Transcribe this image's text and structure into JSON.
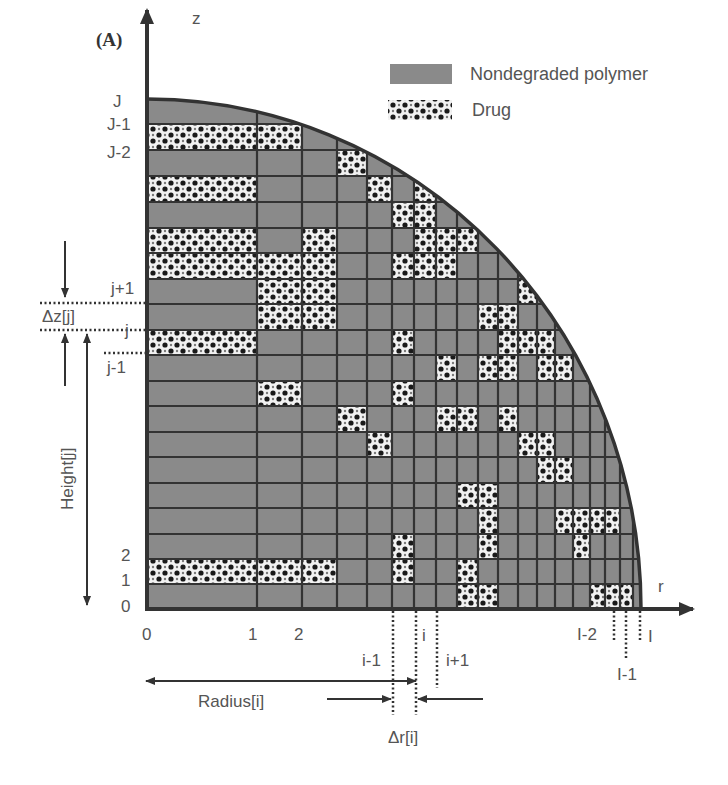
{
  "figure": {
    "panel_label": "(A)",
    "colors": {
      "polymer": "#8a8a8a",
      "grid_line": "#333333",
      "axis": "#333333",
      "drug_bg": "#f2f2f2",
      "drug_dot": "#1a1a1a",
      "text": "#555555"
    },
    "geometry": {
      "origin": [
        147,
        609
      ],
      "radius_r": 494,
      "radius_z": 510,
      "col_lines": [
        147,
        257,
        302,
        337,
        367,
        392,
        414,
        436,
        457,
        478,
        498,
        518,
        537,
        555,
        573,
        590,
        605,
        620,
        633,
        641
      ],
      "row_lines": [
        609,
        584,
        559,
        534,
        508,
        483,
        457,
        432,
        406,
        381,
        355,
        330,
        304,
        279,
        253,
        228,
        202,
        176,
        150,
        124,
        99
      ]
    },
    "drug_cells": [
      [
        0,
        1
      ],
      [
        1,
        1
      ],
      [
        2,
        1
      ],
      [
        1,
        8
      ],
      [
        0,
        10
      ],
      [
        0,
        13
      ],
      [
        0,
        14
      ],
      [
        0,
        16
      ],
      [
        0,
        18
      ],
      [
        1,
        11
      ],
      [
        1,
        12
      ],
      [
        1,
        13
      ],
      [
        2,
        11
      ],
      [
        2,
        12
      ],
      [
        2,
        13
      ],
      [
        2,
        14
      ],
      [
        1,
        18
      ],
      [
        3,
        7
      ],
      [
        4,
        6
      ],
      [
        4,
        16
      ],
      [
        5,
        10
      ],
      [
        5,
        13
      ],
      [
        5,
        15
      ],
      [
        3,
        17
      ],
      [
        6,
        15
      ],
      [
        6,
        16
      ],
      [
        5,
        8
      ],
      [
        5,
        2
      ],
      [
        5,
        1
      ],
      [
        6,
        14
      ],
      [
        7,
        14
      ],
      [
        7,
        7
      ],
      [
        8,
        7
      ],
      [
        6,
        13
      ],
      [
        7,
        13
      ],
      [
        7,
        9
      ],
      [
        8,
        0
      ],
      [
        8,
        1
      ],
      [
        8,
        14
      ],
      [
        8,
        4
      ],
      [
        9,
        4
      ],
      [
        9,
        3
      ],
      [
        9,
        2
      ],
      [
        9,
        0
      ],
      [
        9,
        11
      ],
      [
        10,
        11
      ],
      [
        10,
        10
      ],
      [
        9,
        9
      ],
      [
        11,
        12
      ],
      [
        10,
        9
      ],
      [
        11,
        10
      ],
      [
        11,
        6
      ],
      [
        12,
        6
      ],
      [
        12,
        9
      ],
      [
        13,
        9
      ],
      [
        13,
        3
      ],
      [
        14,
        3
      ],
      [
        15,
        3
      ],
      [
        16,
        3
      ],
      [
        14,
        2
      ],
      [
        15,
        0
      ],
      [
        16,
        0
      ],
      [
        15,
        9
      ],
      [
        13,
        5
      ],
      [
        12,
        5
      ],
      [
        17,
        0
      ],
      [
        12,
        10
      ],
      [
        10,
        7
      ]
    ],
    "legend": {
      "items": [
        {
          "label": "Nondegraded polymer",
          "type": "polymer"
        },
        {
          "label": "Drug",
          "type": "drug"
        }
      ]
    },
    "axes": {
      "z_label": "z",
      "r_label": "r"
    },
    "z_tick_labels": {
      "top": [
        "J",
        "J-1",
        "J-2"
      ],
      "bottom": [
        "2",
        "1",
        "0"
      ]
    },
    "r_tick_labels": [
      "0",
      "1",
      "2"
    ],
    "annotations": {
      "j_plus_1": "j+1",
      "j": "j",
      "j_minus_1": "j-1",
      "delta_z": "Δz[j]",
      "height": "Height[j]",
      "i_minus_1": "i-1",
      "i": "i",
      "i_plus_1": "i+1",
      "radius": "Radius[i]",
      "delta_r": "Δr[i]",
      "I_minus_2": "I-2",
      "I_minus_1": "I-1",
      "I": "I"
    }
  }
}
